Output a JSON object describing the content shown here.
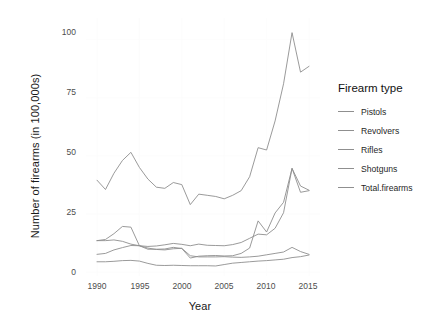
{
  "chart_data": {
    "type": "line",
    "title": "",
    "xlabel": "Year",
    "ylabel": "Number of firearms (in 100,000s)",
    "xlim": [
      1990,
      2015
    ],
    "ylim": [
      0,
      105
    ],
    "xticks": [
      1990,
      1995,
      2000,
      2005,
      2010,
      2015
    ],
    "yticks": [
      0,
      25,
      50,
      75,
      100
    ],
    "grid": "major-minor-white-on-white",
    "legend_position": "right",
    "legend_title": "Firearm type",
    "line_color": "#8f8f8f",
    "x": [
      1990,
      1991,
      1992,
      1993,
      1994,
      1995,
      1996,
      1997,
      1998,
      1999,
      2000,
      2001,
      2002,
      2003,
      2004,
      2005,
      2006,
      2007,
      2008,
      2009,
      2010,
      2011,
      2012,
      2013,
      2014,
      2015
    ],
    "series": [
      {
        "name": "Pistols",
        "values": [
          13.5,
          13.5,
          13.8,
          13.2,
          12.0,
          11.3,
          11.0,
          11.2,
          11.7,
          12.3,
          11.9,
          11.3,
          12.0,
          11.5,
          11.4,
          11.3,
          11.8,
          12.7,
          14.5,
          16.3,
          16.0,
          18.8,
          25.5,
          44.6,
          37.0,
          35.2
        ]
      },
      {
        "name": "Revolvers",
        "values": [
          13.5,
          14.0,
          16.5,
          19.6,
          19.3,
          11.3,
          10.3,
          9.7,
          9.5,
          10.0,
          10.2,
          7.0,
          6.5,
          6.5,
          6.5,
          6.6,
          6.4,
          6.3,
          6.5,
          6.8,
          7.4,
          8.0,
          8.6,
          10.6,
          8.8,
          7.6
        ]
      },
      {
        "name": "Rifles",
        "values": [
          7.6,
          8.0,
          9.5,
          10.5,
          11.4,
          11.3,
          9.8,
          9.8,
          9.9,
          10.6,
          10.1,
          6.0,
          6.8,
          7.0,
          7.1,
          6.9,
          7.0,
          8.0,
          10.3,
          22.0,
          17.2,
          25.4,
          30.0,
          44.6,
          34.3,
          35.0
        ]
      },
      {
        "name": "Shotguns",
        "values": [
          4.4,
          4.4,
          4.6,
          4.9,
          5.0,
          4.7,
          3.7,
          2.9,
          2.8,
          2.9,
          2.8,
          2.7,
          2.7,
          2.7,
          2.6,
          3.2,
          3.8,
          4.1,
          4.4,
          4.7,
          4.9,
          5.2,
          5.5,
          6.2,
          6.6,
          7.3
        ]
      },
      {
        "name": "Total.firearms",
        "values": [
          39.5,
          35.5,
          42.5,
          48.0,
          51.5,
          45.0,
          40.0,
          36.5,
          36.0,
          38.5,
          37.6,
          29.0,
          33.5,
          33.0,
          32.5,
          31.5,
          33.0,
          35.0,
          41.0,
          53.5,
          52.5,
          65.0,
          81.0,
          103.0,
          86.0,
          88.5
        ]
      }
    ]
  },
  "legend": {
    "title": "Firearm type",
    "items": [
      {
        "label": "Pistols"
      },
      {
        "label": "Revolvers"
      },
      {
        "label": "Rifles"
      },
      {
        "label": "Shotguns"
      },
      {
        "label": "Total.firearms"
      }
    ]
  },
  "axes": {
    "x_title": "Year",
    "y_title": "Number of firearms (in 100,000s)",
    "x_tick_labels": [
      "1990",
      "1995",
      "2000",
      "2005",
      "2010",
      "2015"
    ],
    "y_tick_labels": [
      "0",
      "25",
      "50",
      "75",
      "100"
    ]
  }
}
